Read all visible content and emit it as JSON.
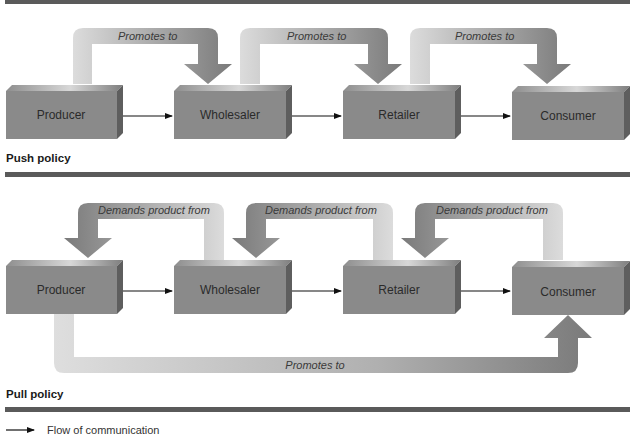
{
  "colors": {
    "box_front": "#8a8a8a",
    "box_top": "#a8a8a8",
    "box_side": "#5e5e5e",
    "arrow_dark": "#7d7d7d",
    "arrow_light": "#dcdcdc",
    "rule": "#5a5a5a"
  },
  "push": {
    "title": "Push policy",
    "boxes": [
      "Producer",
      "Wholesaler",
      "Retailer",
      "Consumer"
    ],
    "arrows": [
      "Promotes to",
      "Promotes to",
      "Promotes to"
    ]
  },
  "pull": {
    "title": "Pull policy",
    "boxes": [
      "Producer",
      "Wholesaler",
      "Retailer",
      "Consumer"
    ],
    "arrows": [
      "Demands product from",
      "Demands product from",
      "Demands product from"
    ],
    "bottom_arrow": "Promotes to"
  },
  "legend": {
    "icon": "arrow-right-icon",
    "label": "Flow of communication"
  }
}
